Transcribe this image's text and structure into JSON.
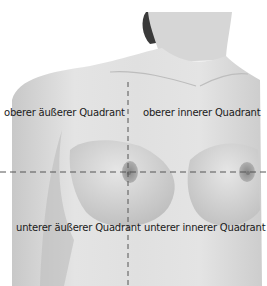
{
  "labels": {
    "upper_outer": "oberer äußerer Quadrant",
    "upper_inner": "oberer innerer Quadrant",
    "lower_outer": "unterer äußerer Quadrant",
    "lower_inner": "unterer innerer Quadrant"
  },
  "colors": {
    "skin_light": "#e8e8e8",
    "skin_mid": "#cfcfcf",
    "skin_shadow": "#a9a9a9",
    "hair": "#3a3a3a",
    "areola": "#9c9c9c",
    "dashed_line": "#555555",
    "background": "#ffffff"
  }
}
